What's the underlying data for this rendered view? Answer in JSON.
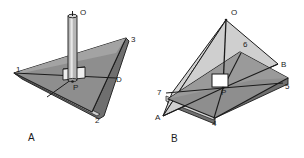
{
  "figure": {
    "background_color": "#ffffff",
    "ink_color": "#1b1b1b",
    "palette": {
      "plane_top": "#8e8e8e",
      "plane_top_light": "#a5a5a5",
      "plane_edge": "#c9c9c9",
      "plane_side": "#6f6f6f",
      "triangle_light": "#d2d2d2",
      "triangle_mid": "#b4b4b4",
      "post_body": "#b9b9b9",
      "post_highlight": "#e4e4e4",
      "collar": "#ededed",
      "square_marker": "#ffffff"
    },
    "panels": [
      {
        "id": "panel-a",
        "caption": "A",
        "caption_pos": [
          28,
          141
        ],
        "description": "A vertical post standing perpendicular at point P on a triangular plane",
        "labels": [
          {
            "text": "O",
            "x": 80,
            "y": 15,
            "name": "label-o-a"
          },
          {
            "text": "1",
            "x": 16,
            "y": 72,
            "name": "label-1-a"
          },
          {
            "text": "3",
            "x": 131,
            "y": 42,
            "name": "label-3-a"
          },
          {
            "text": "D",
            "x": 116,
            "y": 82,
            "name": "label-d-a"
          },
          {
            "text": "2",
            "x": 95,
            "y": 123,
            "name": "label-2-a"
          },
          {
            "text": "P",
            "x": 73,
            "y": 90,
            "name": "label-p-a"
          }
        ]
      },
      {
        "id": "panel-b",
        "caption": "B",
        "caption_pos": [
          171,
          142
        ],
        "description": "A line OP perpendicular to a plane at P, with lines PA, PB and rays 4,5,6,7 drawn in the plane",
        "labels": [
          {
            "text": "O",
            "x": 231,
            "y": 15,
            "name": "label-o-b"
          },
          {
            "text": "6",
            "x": 243,
            "y": 47,
            "name": "label-6-b"
          },
          {
            "text": "B",
            "x": 281,
            "y": 67,
            "name": "label-b-b"
          },
          {
            "text": "5",
            "x": 285,
            "y": 89,
            "name": "label-5-b"
          },
          {
            "text": "7",
            "x": 157,
            "y": 95,
            "name": "label-7-b"
          },
          {
            "text": "A",
            "x": 155,
            "y": 120,
            "name": "label-a-b"
          },
          {
            "text": "P",
            "x": 221,
            "y": 95,
            "name": "label-p-b"
          },
          {
            "text": "4",
            "x": 212,
            "y": 126,
            "name": "label-4-b"
          }
        ]
      }
    ]
  }
}
